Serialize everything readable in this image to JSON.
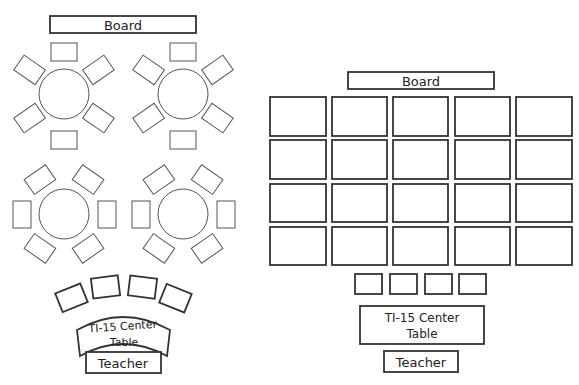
{
  "left_layout": {
    "board_label": "Board",
    "center_table_line1": "TI-15 Center",
    "center_table_line2": "Table",
    "teacher_label": "Teacher",
    "clusters": [
      {
        "cx": 64,
        "cy": 94,
        "arrangement": "top-bottom"
      },
      {
        "cx": 183,
        "cy": 94,
        "arrangement": "top-bottom"
      },
      {
        "cx": 64,
        "cy": 214,
        "arrangement": "left-right"
      },
      {
        "cx": 183,
        "cy": 214,
        "arrangement": "left-right"
      }
    ],
    "round_tables": 4,
    "chairs_per_table": 6,
    "arc_desks": 4
  },
  "right_layout": {
    "board_label": "Board",
    "desk_rows": 4,
    "desk_columns": 5,
    "small_desks": 4,
    "center_table_line1": "TI-15 Center",
    "center_table_line2": "Table",
    "teacher_label": "Teacher"
  },
  "colors": {
    "background": "#ffffff",
    "stroke": "#333333",
    "text": "#222222"
  }
}
